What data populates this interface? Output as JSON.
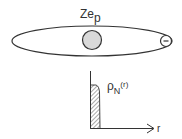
{
  "diagram": {
    "nucleus_charge_label": "Ze",
    "nucleus_charge_subscript": "p",
    "electron_symbol": "−",
    "density_label": "ρ",
    "density_subscript": "N",
    "density_argument": "(r)",
    "axis_label": "r",
    "colors": {
      "stroke": "#333333",
      "nucleus_fill": "#d9d9d9",
      "hatch": "#555555"
    }
  }
}
